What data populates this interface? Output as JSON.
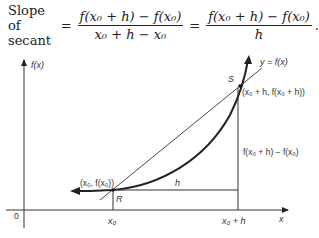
{
  "formula": {
    "prefix": "Slope of secant",
    "equals1": "=",
    "frac1_num": "f(x₀ + h) − f(x₀)",
    "frac1_den": "x₀ + h − x₀",
    "equals2": "=",
    "frac2_num": "f(x₀ + h) − f(x₀)",
    "frac2_den": "h",
    "suffix": "."
  },
  "diagram": {
    "y_axis_label": "f(x)",
    "x_axis_label": "x",
    "origin_label": "0",
    "curve_label": "y = f(x)",
    "point_S": "S",
    "point_S_coords": "(x₀ + h, f(x₀ + h))",
    "point_R": "R",
    "point_R_coords": "(x₀, f(x₀))",
    "h_label": "h",
    "rise_label": "f(x₀ + h) − f(x₀)",
    "x0_tick": "x₀",
    "x0h_tick": "x₀ + h"
  }
}
